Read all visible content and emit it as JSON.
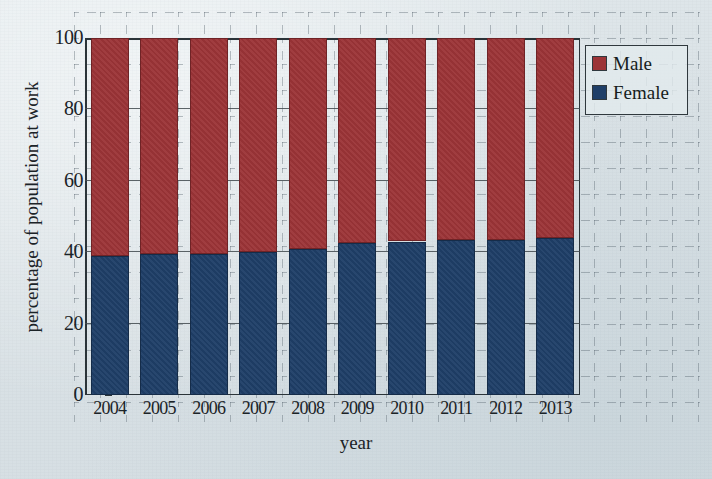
{
  "chart_data": {
    "type": "bar",
    "subtype": "stacked-100-percent",
    "title": "",
    "xlabel": "year",
    "ylabel": "percentage of population at work",
    "categories": [
      "2004",
      "2005",
      "2006",
      "2007",
      "2008",
      "2009",
      "2010",
      "2011",
      "2012",
      "2013"
    ],
    "series": [
      {
        "name": "Female",
        "color": "#1f3f68",
        "values": [
          39,
          39.5,
          39.5,
          40,
          41,
          42.5,
          43,
          43.5,
          43.5,
          44
        ]
      },
      {
        "name": "Male",
        "color": "#9c3437",
        "values": [
          61,
          60.5,
          60.5,
          60,
          59,
          57.5,
          57,
          56.5,
          56.5,
          56
        ]
      }
    ],
    "ylim": [
      0,
      100
    ],
    "yticks": [
      "0",
      "20",
      "40",
      "60",
      "80",
      "100"
    ],
    "ytick_values": [
      0,
      20,
      40,
      60,
      80,
      100
    ],
    "grid": true,
    "grid_style": "dashed graph paper with solid horizontal rules at y ticks",
    "legend": {
      "position": "top-right",
      "entries": [
        {
          "label": "Male",
          "color": "#9c3437",
          "swatch": "square-red"
        },
        {
          "label": "Female",
          "color": "#1f3f68",
          "swatch": "square-blue"
        }
      ]
    },
    "background_color": "#dfe6e9",
    "axis_color": "#2a3338"
  }
}
